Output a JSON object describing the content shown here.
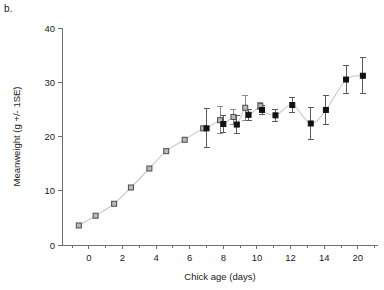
{
  "panel": {
    "label": "b."
  },
  "chart_data": {
    "type": "scatter",
    "title": "",
    "xlabel": "Chick age (days)",
    "ylabel": "Meanweight (g +/- 1SE)",
    "xlim": [
      -1.6,
      17.2
    ],
    "ylim": [
      0,
      40
    ],
    "xticks": [
      0,
      2,
      4,
      6,
      8,
      10,
      12,
      14,
      16
    ],
    "xticklabels": [
      "0",
      "2",
      "4",
      "6",
      "8",
      "10",
      "12",
      "14",
      "20"
    ],
    "xminor_step": 1,
    "yticks": [
      0,
      10,
      20,
      30,
      40
    ],
    "yticklabels": [
      "0",
      "10",
      "20",
      "30",
      "40"
    ],
    "grid": false,
    "legend": "none",
    "series": [
      {
        "name": "growth-curve-open",
        "marker": "open-square",
        "connected": true,
        "color": "#b9b9b9",
        "points": [
          {
            "x": -0.6,
            "y": 3.6,
            "err": 0.0
          },
          {
            "x": 0.4,
            "y": 5.4,
            "err": 0.0
          },
          {
            "x": 1.5,
            "y": 7.6,
            "err": 0.0
          },
          {
            "x": 2.5,
            "y": 10.6,
            "err": 0.0
          },
          {
            "x": 3.6,
            "y": 14.1,
            "err": 0.0
          },
          {
            "x": 4.6,
            "y": 17.3,
            "err": 0.0
          },
          {
            "x": 5.7,
            "y": 19.4,
            "err": 0.0
          },
          {
            "x": 6.8,
            "y": 21.5,
            "err": 0.0
          },
          {
            "x": 7.8,
            "y": 23.0,
            "err": 2.5
          },
          {
            "x": 8.6,
            "y": 23.6,
            "err": 1.3
          },
          {
            "x": 9.3,
            "y": 25.3,
            "err": 2.3
          },
          {
            "x": 10.2,
            "y": 25.6,
            "err": 0.6
          }
        ]
      },
      {
        "name": "mean-weight-filled",
        "marker": "filled-square",
        "connected": false,
        "color": "#111111",
        "points": [
          {
            "x": 7.0,
            "y": 21.5,
            "err": 3.6
          },
          {
            "x": 8.0,
            "y": 22.3,
            "err": 1.5
          },
          {
            "x": 8.8,
            "y": 22.2,
            "err": 1.6
          },
          {
            "x": 9.5,
            "y": 24.0,
            "err": 1.0
          },
          {
            "x": 10.3,
            "y": 24.9,
            "err": 0.8
          },
          {
            "x": 11.1,
            "y": 23.9,
            "err": 1.1
          },
          {
            "x": 12.1,
            "y": 25.8,
            "err": 1.4
          },
          {
            "x": 13.2,
            "y": 22.4,
            "err": 2.9
          },
          {
            "x": 14.1,
            "y": 24.9,
            "err": 2.6
          },
          {
            "x": 15.3,
            "y": 30.5,
            "err": 2.5
          },
          {
            "x": 16.3,
            "y": 31.2,
            "err": 3.3
          }
        ]
      }
    ]
  }
}
